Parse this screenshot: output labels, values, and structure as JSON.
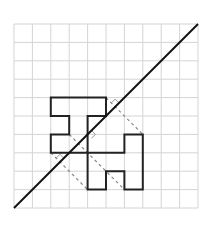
{
  "diagram": {
    "type": "reflection-grid",
    "grid": {
      "cols": 10,
      "rows": 10,
      "origin_px": [
        14,
        24
      ],
      "cell_px": 18.4
    },
    "colors": {
      "grid": "#d4d4d4",
      "shape": "#222222",
      "axis": "#111111",
      "dashed": "#888888",
      "marker": "#999999",
      "background": "#ffffff"
    },
    "mirror_line": {
      "from": [
        0,
        10
      ],
      "to": [
        10,
        0
      ]
    },
    "shapes": [
      {
        "name": "original-shape",
        "points": [
          [
            2,
            4
          ],
          [
            5,
            4
          ],
          [
            5,
            5
          ],
          [
            4,
            5
          ],
          [
            4,
            7
          ],
          [
            2,
            7
          ],
          [
            2,
            6
          ],
          [
            3,
            6
          ],
          [
            3,
            5
          ],
          [
            2,
            5
          ]
        ]
      },
      {
        "name": "reflected-shape",
        "points": [
          [
            4,
            7
          ],
          [
            6,
            7
          ],
          [
            6,
            6
          ],
          [
            7,
            6
          ],
          [
            7,
            9
          ],
          [
            6,
            9
          ],
          [
            6,
            8
          ],
          [
            5,
            8
          ],
          [
            5,
            9
          ],
          [
            4,
            9
          ]
        ]
      }
    ],
    "dashed_lines": [
      {
        "from": [
          5,
          4
        ],
        "to": [
          7,
          6
        ]
      },
      {
        "from": [
          3,
          6
        ],
        "to": [
          6,
          9
        ]
      },
      {
        "from": [
          2,
          7
        ],
        "to": [
          4,
          9
        ]
      }
    ],
    "right_angle_markers": [
      {
        "at": [
          5.5,
          4.5
        ],
        "side": "up"
      },
      {
        "at": [
          4,
          6
        ],
        "side": "down"
      },
      {
        "at": [
          2.5,
          7.5
        ],
        "side": "up"
      }
    ]
  }
}
